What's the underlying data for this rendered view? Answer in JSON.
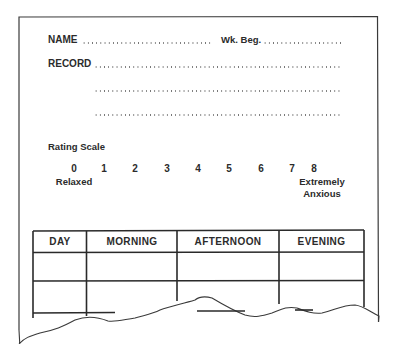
{
  "form": {
    "name_label": "NAME",
    "week_label": "Wk. Beg.",
    "record_label": "RECORD"
  },
  "rating_scale": {
    "title": "Rating Scale",
    "values": [
      "0",
      "1",
      "2",
      "3",
      "4",
      "5",
      "6",
      "7",
      "8"
    ],
    "low_label": "Relaxed",
    "high_label_line1": "Extremely",
    "high_label_line2": "Anxious"
  },
  "table": {
    "headers": [
      "DAY",
      "MORNING",
      "AFTERNOON",
      "EVENING"
    ],
    "rows": [
      [
        "",
        "",
        "",
        ""
      ],
      [
        "",
        "",
        "",
        ""
      ]
    ]
  }
}
